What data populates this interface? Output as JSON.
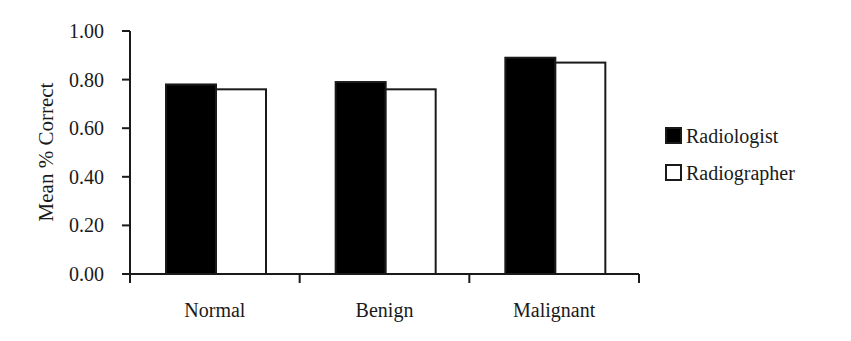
{
  "chart_data": {
    "type": "bar",
    "title": "",
    "xlabel": "",
    "ylabel": "Mean % Correct",
    "ylim": [
      0,
      1.0
    ],
    "yticks": [
      "0.00",
      "0.20",
      "0.40",
      "0.60",
      "0.80",
      "1.00"
    ],
    "categories": [
      "Normal",
      "Benign",
      "Malignant"
    ],
    "series": [
      {
        "name": "Radiologist",
        "color": "#000000",
        "values": [
          0.78,
          0.79,
          0.89
        ]
      },
      {
        "name": "Radiographer",
        "color": "#ffffff",
        "values": [
          0.76,
          0.76,
          0.87
        ]
      }
    ],
    "grid": false,
    "legend_position": "right"
  }
}
